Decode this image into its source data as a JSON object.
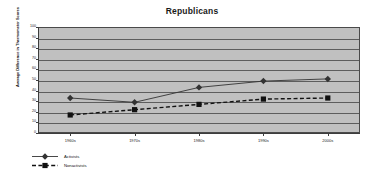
{
  "chart_data": {
    "type": "line",
    "title": "Republicans",
    "xlabel": "",
    "ylabel": "Average Difference in Thermometer Scores",
    "categories": [
      "1960s",
      "1970s",
      "1980s",
      "1990s",
      "2000s"
    ],
    "yticks": [
      0,
      10,
      20,
      30,
      40,
      50,
      60,
      70,
      80,
      90,
      100
    ],
    "ylim": [
      0,
      100
    ],
    "grid": true,
    "legend_position": "bottom-left",
    "series": [
      {
        "name": "Activists",
        "marker": "diamond",
        "linestyle": "solid",
        "color": "#333333",
        "values": [
          33,
          29,
          43,
          49,
          51
        ]
      },
      {
        "name": "Nonactivists",
        "marker": "square",
        "linestyle": "dashed",
        "color": "#111111",
        "values": [
          17,
          22,
          27,
          32,
          33
        ]
      }
    ]
  },
  "style": {
    "plot_background": "#c0c0c0",
    "gridline_color": "#5d5d5d",
    "axis_color": "#3d3d3d",
    "page_background": "#ffffff"
  }
}
